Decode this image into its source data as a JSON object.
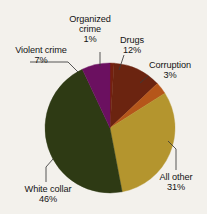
{
  "figure": {
    "title_fragment": "",
    "background_color": "#f3f1ec"
  },
  "chart_data": {
    "type": "pie",
    "title": "",
    "subtitle": "",
    "xlabel": "",
    "ylabel": "",
    "legend_position": "none",
    "grid": false,
    "units": "percent",
    "start_angle_deg": 0,
    "direction": "clockwise",
    "categories": [
      "Organized crime",
      "Drugs",
      "Corruption",
      "All other",
      "White collar",
      "Violent crime"
    ],
    "values": [
      1,
      12,
      3,
      31,
      46,
      7
    ],
    "colors": [
      "#73200f",
      "#6b2410",
      "#b5561a",
      "#b4952e",
      "#2e3a14",
      "#6b1060"
    ],
    "slices": [
      {
        "label": "Organized crime",
        "value": 1,
        "pct_text": "1%",
        "color": "#73200f"
      },
      {
        "label": "Drugs",
        "value": 12,
        "pct_text": "12%",
        "color": "#6b2410"
      },
      {
        "label": "Corruption",
        "value": 3,
        "pct_text": "3%",
        "color": "#b5561a"
      },
      {
        "label": "All other",
        "value": 31,
        "pct_text": "31%",
        "color": "#b4952e"
      },
      {
        "label": "White collar",
        "value": 46,
        "pct_text": "46%",
        "color": "#2e3a14"
      },
      {
        "label": "Violent crime",
        "value": 7,
        "pct_text": "7%",
        "color": "#6b1060"
      }
    ]
  },
  "labels": {
    "organized_crime": {
      "line1": "Organized",
      "line2": "crime",
      "pct": "1%"
    },
    "drugs": {
      "line1": "Drugs",
      "pct": "12%"
    },
    "corruption": {
      "line1": "Corruption",
      "pct": "3%"
    },
    "all_other": {
      "line1": "All other",
      "pct": "31%"
    },
    "white_collar": {
      "line1": "White collar",
      "pct": "46%"
    },
    "violent_crime": {
      "line1": "Violent crime",
      "pct": "7%"
    }
  }
}
